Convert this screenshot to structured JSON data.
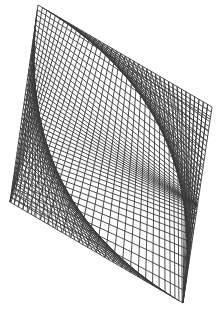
{
  "figure": {
    "line_color": "#3a3a3a",
    "background_color": "#ffffff",
    "families": [
      {
        "name": "top-bottom-family",
        "count": 40,
        "twist": 0.5
      },
      {
        "name": "left-right-family",
        "count": 40,
        "twist": 0.5
      }
    ]
  }
}
